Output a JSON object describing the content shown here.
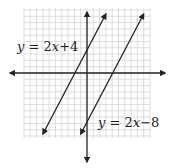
{
  "chart_data": {
    "type": "line",
    "title": "",
    "xlabel": "",
    "ylabel": "",
    "xlim": [
      -10,
      10
    ],
    "ylim": [
      -10,
      10
    ],
    "grid": true,
    "grid_step": 1,
    "axes_arrows": true,
    "series": [
      {
        "name": "y = 2x+4",
        "slope": 2,
        "intercept": 4,
        "x": [
          -7,
          3
        ],
        "y": [
          -10,
          10
        ]
      },
      {
        "name": "y = 2x−8",
        "slope": 2,
        "intercept": -8,
        "x": [
          -1,
          9
        ],
        "y": [
          -10,
          10
        ]
      }
    ],
    "annotations": [
      {
        "text": "y = 2x+4",
        "position": "upper-left"
      },
      {
        "text": "y = 2x−8",
        "position": "lower-right"
      }
    ]
  },
  "labels": {
    "line1": {
      "var": "y",
      "eq": " = 2",
      "x": "x",
      "rest": "+4"
    },
    "line2": {
      "var": "y",
      "eq": " = 2",
      "x": "x",
      "rest": "−8"
    }
  },
  "colors": {
    "grid": "#d0d0d0",
    "axis": "#222222",
    "line": "#222222"
  }
}
